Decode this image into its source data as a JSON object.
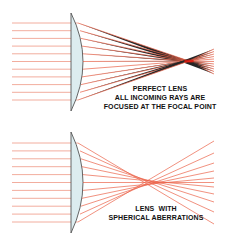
{
  "diagram": {
    "colors": {
      "ray": "#e8472a",
      "ray_incoming": "#f0a493",
      "lens_fill": "#dcecef",
      "lens_stroke": "#555555",
      "focus": "#e0140a",
      "text": "#111111"
    },
    "panels": [
      {
        "name": "perfect-lens",
        "caption_lines": [
          "PERFECT LENS",
          "ALL INCOMING RAYS ARE",
          "FOCUSED AT THE FOCAL POINT"
        ],
        "ray_count": 11,
        "ray_y_start": 23,
        "ray_y_end": 100,
        "lens_x": 72,
        "focal_point": {
          "x": 189,
          "y": 61
        }
      },
      {
        "name": "spherical-aberration-lens",
        "caption_lines": [
          "LENS  WITH",
          "SPHERICAL ABERRATIONS"
        ],
        "ray_count": 11,
        "ray_y_start": 143,
        "ray_y_end": 222,
        "lens_x": 72
      }
    ]
  }
}
